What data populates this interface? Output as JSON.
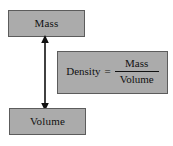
{
  "diagram": {
    "background_color": "#ffffff",
    "box_fill_color": "#ababab",
    "box_border_color": "#5c5c5c",
    "text_color": "#111111",
    "arrow_color": "#111111",
    "nodes": {
      "mass": {
        "label": "Mass",
        "name": "mass-box"
      },
      "volume": {
        "label": "Volume",
        "name": "volume-box"
      }
    },
    "equation": {
      "left_side": "Density",
      "equals": "=",
      "numerator": "Mass",
      "denominator": "Volume",
      "full_text": "Density = Mass / Volume"
    },
    "connector": {
      "name": "double-headed-arrow",
      "from": "Mass",
      "to": "Volume",
      "style": "double-headed vertical arrow"
    }
  }
}
